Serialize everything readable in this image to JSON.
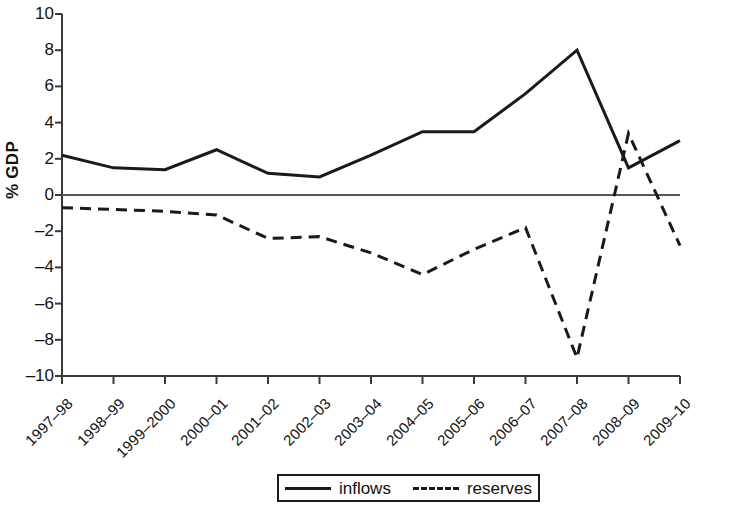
{
  "chart_data": {
    "type": "line",
    "title": "",
    "subtitle": "",
    "xlabel": "",
    "ylabel": "% GDP",
    "ylim": [
      -10,
      10
    ],
    "yticks": [
      "10",
      "8",
      "6",
      "4",
      "2",
      "0",
      "–2",
      "–4",
      "–6",
      "–8",
      "–10"
    ],
    "ytick_values": [
      10,
      8,
      6,
      4,
      2,
      0,
      -2,
      -4,
      -6,
      -8,
      -10
    ],
    "grid": false,
    "legend_position": "bottom",
    "categories": [
      "1997–98",
      "1998–99",
      "1999–2000",
      "2000–01",
      "2001–02",
      "2002–03",
      "2003–04",
      "2004–05",
      "2005–06",
      "2006–07",
      "2007–08",
      "2008–09",
      "2009–10"
    ],
    "series": [
      {
        "name": "inflows",
        "style": "solid",
        "color": "#1a1a1a",
        "values": [
          2.2,
          1.5,
          1.4,
          2.5,
          1.2,
          1.0,
          2.2,
          3.5,
          3.5,
          5.6,
          8.0,
          1.5,
          3.0
        ]
      },
      {
        "name": "reserves",
        "style": "dashed",
        "color": "#1a1a1a",
        "values": [
          -0.7,
          -0.8,
          -0.9,
          -1.1,
          -2.4,
          -2.3,
          -3.2,
          -4.4,
          -3.0,
          -1.8,
          -9.0,
          3.4,
          -2.8
        ]
      }
    ]
  },
  "legend": {
    "items": [
      {
        "label": "inflows",
        "style": "solid"
      },
      {
        "label": "reserves",
        "style": "dashed"
      }
    ]
  },
  "axis": {
    "y_title": "% GDP"
  }
}
